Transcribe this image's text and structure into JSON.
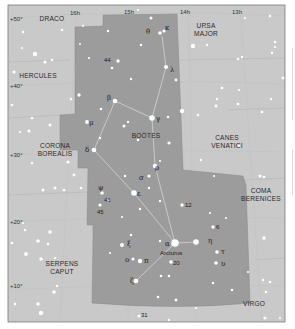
{
  "map": {
    "title": "Boötes star chart",
    "colors": {
      "sky_background": "#c9c9c9",
      "constellation_highlight": "#9b9b9b",
      "boundary_line": "#b5b5b5",
      "figure_line": "#e2e2e2",
      "star": "#ffffff",
      "frame": "#7a7a7a"
    },
    "ra_labels": [
      {
        "text": "16h",
        "x": 73,
        "y": 15
      },
      {
        "text": "15h",
        "x": 127,
        "y": 14
      },
      {
        "text": "14h",
        "x": 184,
        "y": 14
      },
      {
        "text": "13h",
        "x": 235,
        "y": 14
      }
    ],
    "dec_labels": [
      {
        "text": "+50°",
        "x": 10,
        "y": 21
      },
      {
        "text": "+40°",
        "x": 10,
        "y": 88
      },
      {
        "text": "+30°",
        "x": 10,
        "y": 157
      },
      {
        "text": "+20°",
        "x": 10,
        "y": 224
      },
      {
        "text": "+10°",
        "x": 10,
        "y": 288
      }
    ],
    "constellations": [
      {
        "id": "draco",
        "lines": [
          "DRACO"
        ],
        "x": 40,
        "y": 21
      },
      {
        "id": "ursa-major",
        "lines": [
          "URSA",
          "MAJOR"
        ],
        "x": 205,
        "y": 28
      },
      {
        "id": "hercules",
        "lines": [
          "HERCULES"
        ],
        "x": 30,
        "y": 77
      },
      {
        "id": "bootes",
        "lines": [
          "BOÖTES"
        ],
        "x": 135,
        "y": 137
      },
      {
        "id": "corona-borealis",
        "lines": [
          "CORONA",
          "BOREALIS"
        ],
        "x": 55,
        "y": 147
      },
      {
        "id": "canes-venatici",
        "lines": [
          "CANES",
          "VENATICI"
        ],
        "x": 227,
        "y": 141
      },
      {
        "id": "coma-berenices",
        "lines": [
          "COMA",
          "BERENICES"
        ],
        "x": 259,
        "y": 193
      },
      {
        "id": "serpens-caput",
        "lines": [
          "SERPENS",
          "CAPUT"
        ],
        "x": 62,
        "y": 268
      },
      {
        "id": "virgo",
        "lines": [
          "VIRGO"
        ],
        "x": 254,
        "y": 306
      }
    ],
    "star_labels": [
      {
        "text": "θ",
        "x": 147,
        "y": 33,
        "type": "greek"
      },
      {
        "text": "κ",
        "x": 165,
        "y": 30,
        "type": "greek"
      },
      {
        "text": "λ",
        "x": 171,
        "y": 71,
        "type": "greek"
      },
      {
        "text": "44",
        "x": 103,
        "y": 61,
        "type": "num"
      },
      {
        "text": "β",
        "x": 108,
        "y": 101,
        "type": "greek"
      },
      {
        "text": "γ",
        "x": 156,
        "y": 122,
        "type": "greek"
      },
      {
        "text": "μ",
        "x": 88,
        "y": 124,
        "type": "greek"
      },
      {
        "text": "δ",
        "x": 86,
        "y": 152,
        "type": "greek"
      },
      {
        "text": "ρ",
        "x": 155,
        "y": 170,
        "type": "greek"
      },
      {
        "text": "σ",
        "x": 140,
        "y": 181,
        "type": "greek"
      },
      {
        "text": "ε",
        "x": 137,
        "y": 196,
        "type": "greek"
      },
      {
        "text": "ψ",
        "x": 100,
        "y": 189,
        "type": "greek"
      },
      {
        "text": "46",
        "x": 104,
        "y": 201,
        "type": "num"
      },
      {
        "text": "45",
        "x": 97,
        "y": 213,
        "type": "num"
      },
      {
        "text": "12",
        "x": 184,
        "y": 206,
        "type": "num"
      },
      {
        "text": "6",
        "x": 215,
        "y": 229,
        "type": "num"
      },
      {
        "text": "ξ",
        "x": 128,
        "y": 246,
        "type": "greek"
      },
      {
        "text": "α",
        "x": 166,
        "y": 245,
        "type": "greek"
      },
      {
        "text": "Arcturus",
        "x": 160,
        "y": 254,
        "type": "num"
      },
      {
        "text": "η",
        "x": 209,
        "y": 243,
        "type": "greek"
      },
      {
        "text": "τ",
        "x": 222,
        "y": 253,
        "type": "greek"
      },
      {
        "text": "υ",
        "x": 222,
        "y": 265,
        "type": "greek"
      },
      {
        "text": "ο",
        "x": 126,
        "y": 261,
        "type": "greek"
      },
      {
        "text": "π",
        "x": 145,
        "y": 262,
        "type": "greek"
      },
      {
        "text": "20",
        "x": 173,
        "y": 264,
        "type": "num"
      },
      {
        "text": "ζ",
        "x": 131,
        "y": 282,
        "type": "greek"
      },
      {
        "text": "31",
        "x": 141,
        "y": 316,
        "type": "num"
      }
    ]
  }
}
